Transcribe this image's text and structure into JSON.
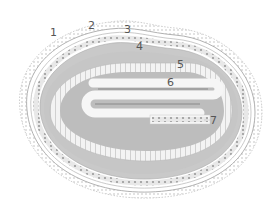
{
  "diagram": {
    "type": "cross-section",
    "labels": [
      {
        "id": "1",
        "text": "1",
        "x": 50,
        "y": 27
      },
      {
        "id": "2",
        "text": "2",
        "x": 88,
        "y": 20
      },
      {
        "id": "3",
        "text": "3",
        "x": 124,
        "y": 24
      },
      {
        "id": "4",
        "text": "4",
        "x": 136,
        "y": 41
      },
      {
        "id": "5",
        "text": "5",
        "x": 177,
        "y": 59
      },
      {
        "id": "6",
        "text": "6",
        "x": 167,
        "y": 77
      },
      {
        "id": "7",
        "text": "7",
        "x": 210,
        "y": 115
      }
    ],
    "colors": {
      "outer_fringe": "#c8c8c8",
      "ring_lines": "#a8a8a8",
      "dark_band": "#c4c4c4",
      "light_band": "#f0f0f0",
      "inner_fill": "#bdbdbd",
      "tube_light": "#f6f6f6",
      "tube_dark": "#9e9e9e",
      "label": "#555555"
    }
  }
}
